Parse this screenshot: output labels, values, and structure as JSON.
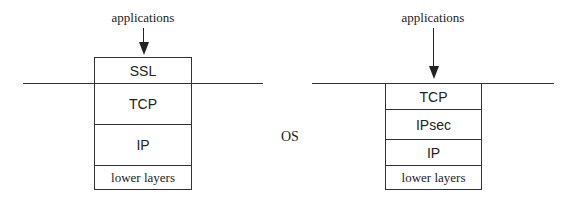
{
  "left_stack": {
    "top_label": "applications",
    "layers": [
      {
        "label": "SSL",
        "font": "sans"
      },
      {
        "label": "TCP",
        "font": "sans"
      },
      {
        "label": "IP",
        "font": "sans"
      },
      {
        "label": "lower layers",
        "font": "serif"
      }
    ]
  },
  "right_stack": {
    "top_label": "applications",
    "layers": [
      {
        "label": "TCP",
        "font": "sans"
      },
      {
        "label": "IPsec",
        "font": "sans"
      },
      {
        "label": "IP",
        "font": "sans"
      },
      {
        "label": "lower layers",
        "font": "serif"
      }
    ]
  },
  "center_label": "OS",
  "colors": {
    "stroke": "#333333",
    "background": "#ffffff"
  }
}
